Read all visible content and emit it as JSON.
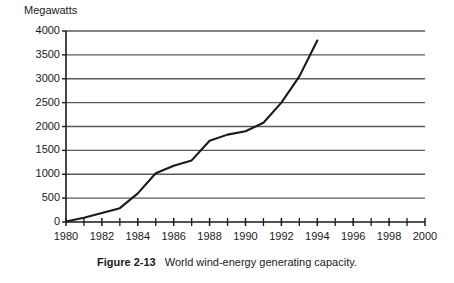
{
  "figure": {
    "caption_label": "Figure 2-13",
    "caption_text": "World wind-energy generating capacity."
  },
  "chart_data": {
    "type": "line",
    "title": "",
    "subtitle": "",
    "xlabel": "",
    "ylabel": "Megawatts",
    "xlim": [
      1980,
      2000
    ],
    "ylim": [
      0,
      4000
    ],
    "grid": "horizontal",
    "legend": "none",
    "x_tick_labels": [
      "1980",
      "1982",
      "1984",
      "1986",
      "1988",
      "1990",
      "1992",
      "1994",
      "1996",
      "1998",
      "2000"
    ],
    "x_tick_values": [
      1980,
      1982,
      1984,
      1986,
      1988,
      1990,
      1992,
      1994,
      1996,
      1998,
      2000
    ],
    "x_minor_ticks": [
      1981,
      1983,
      1985,
      1987,
      1989,
      1991,
      1993,
      1995,
      1997,
      1999
    ],
    "y_tick_labels": [
      "0",
      "500",
      "1000",
      "1500",
      "2000",
      "2500",
      "3000",
      "3500",
      "4000"
    ],
    "y_tick_values": [
      0,
      500,
      1000,
      1500,
      2000,
      2500,
      3000,
      3500,
      4000
    ],
    "series": [
      {
        "name": "World wind-energy generating capacity",
        "color": "#1a1a1a",
        "x": [
          1980,
          1981,
          1982,
          1983,
          1984,
          1985,
          1986,
          1987,
          1988,
          1989,
          1990,
          1991,
          1992,
          1993,
          1994
        ],
        "values": [
          10,
          90,
          190,
          290,
          600,
          1020,
          1180,
          1290,
          1700,
          1830,
          1900,
          2080,
          2500,
          3050,
          3800
        ]
      }
    ],
    "line_color": "#1a1a1a",
    "grid_color": "#5a5a5a",
    "axis_color": "#1a1a1a",
    "background": "#ffffff"
  }
}
